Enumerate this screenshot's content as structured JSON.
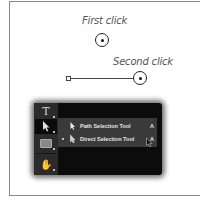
{
  "diagram": {
    "first_click_label": "First click",
    "second_click_label": "Second click"
  },
  "toolbar": {
    "tools": [
      {
        "name": "type-tool",
        "glyph": "T"
      },
      {
        "name": "selection-tool",
        "glyph": "▶",
        "selected": true
      },
      {
        "name": "rectangle-tool",
        "glyph": "▭"
      },
      {
        "name": "hand-tool",
        "glyph": "✋"
      }
    ]
  },
  "flyout": {
    "items": [
      {
        "label": "Path Selection Tool",
        "shortcut": "A",
        "active": false
      },
      {
        "label": "Direct Selection Tool",
        "shortcut": "A",
        "active": true
      }
    ]
  },
  "colors": {
    "panel_bg": "#0c0c0c",
    "toolcol_bg": "#2b2b2b",
    "flyout_bg": "#3a3a3a",
    "text_light": "#e6e6e6",
    "label_gray": "#555555"
  }
}
